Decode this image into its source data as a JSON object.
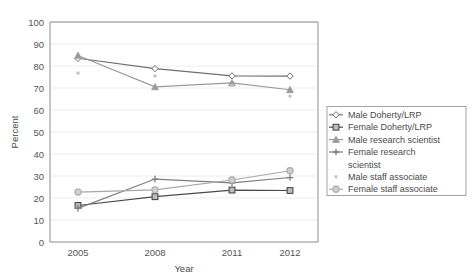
{
  "chart_data": {
    "type": "line",
    "title": "",
    "xlabel": "Year",
    "ylabel": "Percent",
    "categories": [
      "2005",
      "2008",
      "2011",
      "2012"
    ],
    "x": [
      2005,
      2008,
      2011,
      2012
    ],
    "ylim": [
      0,
      100
    ],
    "yticks": [
      0,
      10,
      20,
      30,
      40,
      50,
      60,
      70,
      80,
      90,
      100
    ],
    "grid": "horizontal",
    "legend_position": "right",
    "series": [
      {
        "name": "Male Doherty/LRP",
        "marker": "diamond",
        "color": "#6f6f6f",
        "values": [
          83.5,
          78.8,
          75.5,
          75.4
        ]
      },
      {
        "name": "Female Doherty/LRP",
        "marker": "square",
        "color": "#4a4a4a",
        "values": [
          16.6,
          20.6,
          23.6,
          23.4
        ]
      },
      {
        "name": "Male research scientist",
        "marker": "triangle",
        "color": "#9a9a9a",
        "values": [
          84.8,
          70.5,
          72.3,
          69.2
        ]
      },
      {
        "name": "Female research scientist",
        "marker": "plus",
        "color": "#7d7d7d",
        "values": [
          15.3,
          28.6,
          26.9,
          29.3
        ]
      },
      {
        "name": "Male staff associate",
        "marker": "dot",
        "color": "#c2c2c2",
        "values": [
          76.8,
          75.5,
          71.2,
          66.3
        ]
      },
      {
        "name": "Female staff associate",
        "marker": "circle",
        "color": "#a8a8a8",
        "values": [
          22.7,
          23.7,
          28.2,
          32.4
        ]
      }
    ]
  },
  "legend": {
    "items": [
      {
        "label": "Male Doherty/LRP",
        "marker": "diamond"
      },
      {
        "label": "Female Doherty/LRP",
        "marker": "square"
      },
      {
        "label": "Male research scientist",
        "marker": "triangle"
      },
      {
        "label": "Female research",
        "label2": "scientist",
        "marker": "plus"
      },
      {
        "label": "Male staff associate",
        "marker": "dot"
      },
      {
        "label": "Female staff associate",
        "marker": "circle"
      }
    ]
  },
  "axes": {
    "ylabel": "Percent",
    "xlabel": "Year",
    "ytick_labels": [
      "100",
      "90",
      "80",
      "70",
      "60",
      "50",
      "40",
      "30",
      "20",
      "10",
      "0"
    ],
    "xtick_labels": [
      "2005",
      "2008",
      "2011",
      "2012"
    ]
  }
}
